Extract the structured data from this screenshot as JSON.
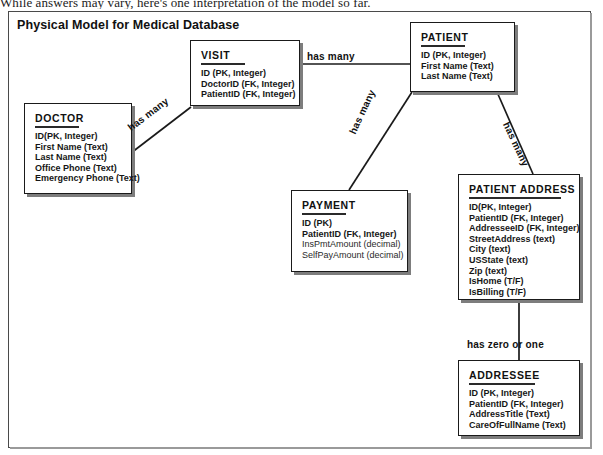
{
  "page": {
    "caption_above": "While answers may vary, here's one interpretation of the model so far."
  },
  "diagram": {
    "title": "Physical Model for Medical Database",
    "entities": [
      {
        "id": "doctor",
        "name": "DOCTOR",
        "fields": [
          "ID(PK, Integer)",
          "First Name (Text)",
          "Last Name (Text)",
          "Office Phone (Text)",
          "Emergency Phone (Text)"
        ]
      },
      {
        "id": "visit",
        "name": "VISIT",
        "fields": [
          "ID (PK, Integer)",
          "DoctorID (FK, Integer)",
          "PatientID (FK, Integer)"
        ]
      },
      {
        "id": "patient",
        "name": "PATIENT",
        "fields": [
          "ID (PK, Integer)",
          "First Name (Text)",
          "Last Name (Text)"
        ]
      },
      {
        "id": "payment",
        "name": "PAYMENT",
        "fields": [
          "ID (PK)",
          "PatientID (FK, Integer)",
          "InsPmtAmount (decimal)",
          "SelfPayAmount (decimal)"
        ]
      },
      {
        "id": "patient_address",
        "name": "PATIENT ADDRESS",
        "fields": [
          "ID(PK, Integer)",
          "PatientID (FK, Integer)",
          "AddresseeID (FK, Integer)",
          "StreetAddress (text)",
          "City (text)",
          "USState (text)",
          "Zip (text)",
          "IsHome (T/F)",
          "IsBilling (T/F)"
        ]
      },
      {
        "id": "addressee",
        "name": "ADDRESSEE",
        "fields": [
          "ID (PK, Integer)",
          "PatientID (FK, Integer)",
          "AddressTitle (Text)",
          "CareOfFullName (Text)"
        ]
      }
    ],
    "relationships": [
      {
        "id": "doctor_visit",
        "label": "has many",
        "from": "doctor",
        "to": "visit"
      },
      {
        "id": "visit_patient",
        "label": "has many",
        "from": "visit",
        "to": "patient"
      },
      {
        "id": "patient_payment",
        "label": "has many",
        "from": "patient",
        "to": "payment"
      },
      {
        "id": "patient_patientaddress",
        "label": "has many",
        "from": "patient",
        "to": "patient_address"
      },
      {
        "id": "patientaddress_addressee",
        "label": "has zero or one",
        "from": "patient_address",
        "to": "addressee"
      }
    ]
  }
}
